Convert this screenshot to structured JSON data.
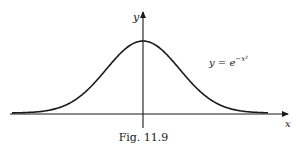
{
  "figure": {
    "caption": "Fig. 11.9",
    "axes": {
      "x_label": "x",
      "y_label": "y"
    },
    "curve_label": {
      "lhs": "y = e",
      "exponent": "−x²"
    },
    "colors": {
      "ink": "#1a1a1a",
      "background": "#ffffff"
    }
  },
  "chart_data": {
    "type": "line",
    "title": "",
    "caption": "Fig. 11.9",
    "xlabel": "x",
    "ylabel": "y",
    "function": "y = e^(-x^2)",
    "series": [
      {
        "name": "y = e^(-x^2)",
        "x": [
          -2.5,
          -2.0,
          -1.5,
          -1.0,
          -0.5,
          0.0,
          0.5,
          1.0,
          1.5,
          2.0,
          2.5
        ],
        "values": [
          0.002,
          0.018,
          0.105,
          0.368,
          0.779,
          1.0,
          0.779,
          0.368,
          0.105,
          0.018,
          0.002
        ]
      }
    ],
    "grid": false,
    "ticks": "none",
    "annotations": [
      "y = e^(-x^2)"
    ]
  }
}
